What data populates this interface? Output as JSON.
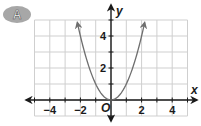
{
  "badge": {
    "label": "A",
    "color": "#a7a7a7"
  },
  "chart_data": {
    "type": "line",
    "title": "",
    "function": "y = x^2",
    "xlabel": "x",
    "ylabel": "y",
    "origin_label": "O",
    "xlim": [
      -5,
      5
    ],
    "ylim": [
      -1,
      5
    ],
    "x_ticks": [
      -4,
      -2,
      2,
      4
    ],
    "x_tick_labels": [
      "−4",
      "−2",
      "2",
      "4"
    ],
    "y_ticks": [
      2,
      4
    ],
    "y_tick_labels": [
      "2",
      "4"
    ],
    "grid": true,
    "series": [
      {
        "name": "parabola",
        "x": [
          -2.2,
          -2,
          -1.5,
          -1,
          -0.5,
          0,
          0.5,
          1,
          1.5,
          2,
          2.2
        ],
        "y": [
          4.84,
          4,
          2.25,
          1,
          0.25,
          0,
          0.25,
          1,
          2.25,
          4,
          4.84
        ],
        "arrows_at_ends": true,
        "color": "#6e6e6e"
      }
    ]
  }
}
